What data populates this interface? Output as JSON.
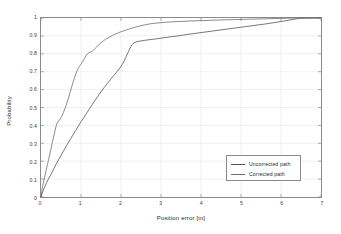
{
  "figure": {
    "background": "#ffffff",
    "frame_color": "#8a8a8a"
  },
  "chart_data": {
    "type": "line",
    "title": "",
    "xlabel": "Position error [m]",
    "ylabel": "Probability",
    "xlim": [
      0,
      7
    ],
    "ylim": [
      0,
      1
    ],
    "xticks": [
      "0",
      "1",
      "2",
      "3",
      "4",
      "5",
      "6",
      "7"
    ],
    "yticks": [
      "0",
      "0.1",
      "0.2",
      "0.3",
      "0.4",
      "0.5",
      "0.6",
      "0.7",
      "0.8",
      "0.9",
      "1"
    ],
    "grid": true,
    "grid_color": "#e8e8e8",
    "legend_position": "lower right",
    "series": [
      {
        "name": "Uncorrected path",
        "color": "#555555",
        "points": [
          [
            0.0,
            0.0
          ],
          [
            0.03,
            0.02
          ],
          [
            0.06,
            0.04
          ],
          [
            0.1,
            0.06
          ],
          [
            0.14,
            0.08
          ],
          [
            0.18,
            0.098
          ],
          [
            0.23,
            0.118
          ],
          [
            0.28,
            0.14
          ],
          [
            0.33,
            0.162
          ],
          [
            0.38,
            0.185
          ],
          [
            0.44,
            0.208
          ],
          [
            0.5,
            0.232
          ],
          [
            0.56,
            0.256
          ],
          [
            0.62,
            0.28
          ],
          [
            0.68,
            0.303
          ],
          [
            0.74,
            0.325
          ],
          [
            0.8,
            0.347
          ],
          [
            0.87,
            0.372
          ],
          [
            0.94,
            0.398
          ],
          [
            1.0,
            0.42
          ],
          [
            1.07,
            0.443
          ],
          [
            1.14,
            0.468
          ],
          [
            1.21,
            0.492
          ],
          [
            1.28,
            0.516
          ],
          [
            1.35,
            0.54
          ],
          [
            1.42,
            0.562
          ],
          [
            1.5,
            0.588
          ],
          [
            1.58,
            0.612
          ],
          [
            1.66,
            0.635
          ],
          [
            1.74,
            0.657
          ],
          [
            1.82,
            0.678
          ],
          [
            1.9,
            0.7
          ],
          [
            1.97,
            0.72
          ],
          [
            2.03,
            0.74
          ],
          [
            2.08,
            0.76
          ],
          [
            2.12,
            0.78
          ],
          [
            2.16,
            0.8
          ],
          [
            2.2,
            0.82
          ],
          [
            2.24,
            0.838
          ],
          [
            2.28,
            0.852
          ],
          [
            2.33,
            0.862
          ],
          [
            2.4,
            0.868
          ],
          [
            2.5,
            0.872
          ],
          [
            2.62,
            0.876
          ],
          [
            2.75,
            0.88
          ],
          [
            2.9,
            0.884
          ],
          [
            3.05,
            0.889
          ],
          [
            3.25,
            0.895
          ],
          [
            3.45,
            0.901
          ],
          [
            3.65,
            0.908
          ],
          [
            3.85,
            0.914
          ],
          [
            4.05,
            0.92
          ],
          [
            4.25,
            0.926
          ],
          [
            4.45,
            0.932
          ],
          [
            4.65,
            0.938
          ],
          [
            4.85,
            0.944
          ],
          [
            5.05,
            0.95
          ],
          [
            5.25,
            0.956
          ],
          [
            5.45,
            0.962
          ],
          [
            5.65,
            0.968
          ],
          [
            5.85,
            0.975
          ],
          [
            6.05,
            0.982
          ],
          [
            6.25,
            0.99
          ],
          [
            6.4,
            0.996
          ],
          [
            6.55,
            0.999
          ],
          [
            6.8,
            1.0
          ],
          [
            7.0,
            1.0
          ]
        ]
      },
      {
        "name": "Corrected path",
        "color": "#6e6e6e",
        "points": [
          [
            0.0,
            0.0
          ],
          [
            0.02,
            0.03
          ],
          [
            0.04,
            0.06
          ],
          [
            0.07,
            0.09
          ],
          [
            0.1,
            0.12
          ],
          [
            0.13,
            0.15
          ],
          [
            0.16,
            0.18
          ],
          [
            0.19,
            0.21
          ],
          [
            0.22,
            0.24
          ],
          [
            0.25,
            0.27
          ],
          [
            0.28,
            0.3
          ],
          [
            0.31,
            0.33
          ],
          [
            0.34,
            0.36
          ],
          [
            0.37,
            0.39
          ],
          [
            0.4,
            0.412
          ],
          [
            0.44,
            0.424
          ],
          [
            0.48,
            0.436
          ],
          [
            0.52,
            0.452
          ],
          [
            0.56,
            0.472
          ],
          [
            0.6,
            0.495
          ],
          [
            0.64,
            0.52
          ],
          [
            0.68,
            0.548
          ],
          [
            0.72,
            0.578
          ],
          [
            0.76,
            0.61
          ],
          [
            0.8,
            0.64
          ],
          [
            0.84,
            0.668
          ],
          [
            0.88,
            0.693
          ],
          [
            0.92,
            0.714
          ],
          [
            0.96,
            0.73
          ],
          [
            1.0,
            0.742
          ],
          [
            1.04,
            0.756
          ],
          [
            1.08,
            0.772
          ],
          [
            1.12,
            0.788
          ],
          [
            1.16,
            0.8
          ],
          [
            1.2,
            0.806
          ],
          [
            1.26,
            0.812
          ],
          [
            1.32,
            0.822
          ],
          [
            1.38,
            0.836
          ],
          [
            1.44,
            0.85
          ],
          [
            1.5,
            0.862
          ],
          [
            1.56,
            0.872
          ],
          [
            1.62,
            0.882
          ],
          [
            1.7,
            0.892
          ],
          [
            1.78,
            0.902
          ],
          [
            1.86,
            0.91
          ],
          [
            1.94,
            0.918
          ],
          [
            2.02,
            0.925
          ],
          [
            2.12,
            0.932
          ],
          [
            2.22,
            0.94
          ],
          [
            2.34,
            0.948
          ],
          [
            2.46,
            0.955
          ],
          [
            2.6,
            0.962
          ],
          [
            2.75,
            0.968
          ],
          [
            2.9,
            0.972
          ],
          [
            3.05,
            0.975
          ],
          [
            3.25,
            0.978
          ],
          [
            3.5,
            0.981
          ],
          [
            3.8,
            0.984
          ],
          [
            4.1,
            0.986
          ],
          [
            4.45,
            0.989
          ],
          [
            4.8,
            0.991
          ],
          [
            5.15,
            0.993
          ],
          [
            5.5,
            0.995
          ],
          [
            5.85,
            0.997
          ],
          [
            6.2,
            0.999
          ],
          [
            6.6,
            1.0
          ],
          [
            7.0,
            1.0
          ]
        ]
      }
    ]
  },
  "legend": {
    "entries": [
      {
        "label": "Uncorrected path"
      },
      {
        "label": "Corrected path"
      }
    ]
  }
}
